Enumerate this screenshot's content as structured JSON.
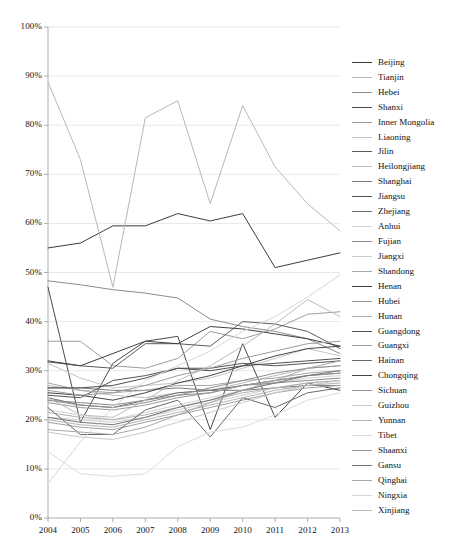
{
  "chart_data": {
    "type": "line",
    "title": "",
    "xlabel": "",
    "ylabel": "",
    "x": [
      2004,
      2005,
      2006,
      2007,
      2008,
      2009,
      2010,
      2011,
      2012,
      2013
    ],
    "xticklabels": [
      "2004",
      "2005",
      "2006",
      "2007",
      "2008",
      "2009",
      "2010",
      "2011",
      "2012",
      "2013"
    ],
    "yticklabels": [
      "0%",
      "10%",
      "20%",
      "30%",
      "40%",
      "50%",
      "60%",
      "70%",
      "80%",
      "90%",
      "100%"
    ],
    "yticks": [
      0,
      10,
      20,
      30,
      40,
      50,
      60,
      70,
      80,
      90,
      100
    ],
    "ylim": [
      0,
      100
    ],
    "grid": "horizontal",
    "legend_position": "right",
    "units": "percent",
    "series": [
      {
        "name": "Beijing",
        "color": "#3d3d3d",
        "values": [
          55.0,
          56.0,
          59.5,
          59.5,
          62.0,
          60.5,
          62.0,
          51.0,
          52.5,
          54.0
        ]
      },
      {
        "name": "Tianjin",
        "color": "#b8b8b8",
        "values": [
          88.8,
          73.0,
          47.0,
          81.5,
          85.0,
          64.0,
          84.0,
          71.5,
          64.0,
          58.5
        ]
      },
      {
        "name": "Hebei",
        "color": "#8c8c8c",
        "values": [
          48.3,
          47.5,
          46.5,
          45.8,
          44.8,
          40.5,
          39.0,
          38.0,
          36.5,
          33.5
        ]
      },
      {
        "name": "Shanxi",
        "color": "#4a4a4a",
        "values": [
          47.0,
          19.5,
          31.5,
          36.0,
          37.0,
          18.0,
          35.5,
          20.5,
          27.5,
          26.0
        ]
      },
      {
        "name": "Inner Mongolia",
        "color": "#9e9e9e",
        "values": [
          36.0,
          36.0,
          31.0,
          30.5,
          32.5,
          38.0,
          36.5,
          38.5,
          41.5,
          42.0
        ]
      },
      {
        "name": "Liaoning",
        "color": "#c4c4c4",
        "values": [
          31.5,
          28.5,
          26.5,
          27.0,
          27.5,
          28.5,
          30.5,
          32.5,
          34.5,
          33.0
        ]
      },
      {
        "name": "Jilin",
        "color": "#5c5c5c",
        "values": [
          31.8,
          31.0,
          30.5,
          35.5,
          35.5,
          35.0,
          40.0,
          39.5,
          38.0,
          34.5
        ]
      },
      {
        "name": "Heilongjiang",
        "color": "#bfbfbf",
        "values": [
          27.0,
          26.0,
          25.0,
          24.5,
          25.5,
          26.0,
          27.5,
          29.0,
          30.5,
          31.0
        ]
      },
      {
        "name": "Shanghai",
        "color": "#7a7a7a",
        "values": [
          26.5,
          26.5,
          26.0,
          26.0,
          26.5,
          26.0,
          26.0,
          26.5,
          27.0,
          27.0
        ]
      },
      {
        "name": "Jiangsu",
        "color": "#545454",
        "values": [
          25.0,
          24.5,
          28.0,
          29.0,
          30.5,
          30.5,
          31.5,
          31.0,
          31.5,
          32.0
        ]
      },
      {
        "name": "Zhejiang",
        "color": "#6e6e6e",
        "values": [
          24.5,
          23.0,
          22.5,
          24.0,
          25.5,
          26.0,
          27.0,
          28.0,
          29.0,
          29.5
        ]
      },
      {
        "name": "Anhui",
        "color": "#d2d2d2",
        "values": [
          22.0,
          21.0,
          20.0,
          21.5,
          23.0,
          24.5,
          26.0,
          27.5,
          28.5,
          29.0
        ]
      },
      {
        "name": "Fujian",
        "color": "#8a8a8a",
        "values": [
          24.0,
          23.5,
          23.0,
          24.0,
          25.0,
          25.5,
          27.0,
          27.5,
          28.0,
          28.5
        ]
      },
      {
        "name": "Jiangxi",
        "color": "#cccccc",
        "values": [
          20.5,
          20.0,
          19.5,
          20.5,
          22.0,
          23.5,
          25.0,
          26.5,
          27.5,
          28.0
        ]
      },
      {
        "name": "Shandong",
        "color": "#a6a6a6",
        "values": [
          27.5,
          26.0,
          25.5,
          26.0,
          27.0,
          27.0,
          28.0,
          28.5,
          29.5,
          30.0
        ]
      },
      {
        "name": "Henan",
        "color": "#3f3f3f",
        "values": [
          32.0,
          31.0,
          33.5,
          36.0,
          35.5,
          39.0,
          38.5,
          37.5,
          36.5,
          35.0
        ]
      },
      {
        "name": "Hubei",
        "color": "#9a9a9a",
        "values": [
          23.5,
          22.5,
          22.0,
          23.0,
          24.5,
          25.5,
          27.0,
          28.0,
          29.0,
          29.5
        ]
      },
      {
        "name": "Hunan",
        "color": "#b0b0b0",
        "values": [
          21.5,
          20.5,
          20.0,
          21.0,
          22.5,
          24.0,
          25.5,
          26.5,
          27.5,
          28.0
        ]
      },
      {
        "name": "Guangdong",
        "color": "#4f4f4f",
        "values": [
          26.5,
          26.5,
          27.0,
          28.5,
          30.5,
          30.0,
          31.0,
          31.5,
          32.0,
          32.5
        ]
      },
      {
        "name": "Guangxi",
        "color": "#a0a0a0",
        "values": [
          19.5,
          18.5,
          18.0,
          19.5,
          21.0,
          22.5,
          24.0,
          25.5,
          26.5,
          27.0
        ]
      },
      {
        "name": "Hainan",
        "color": "#6a6a6a",
        "values": [
          22.5,
          17.0,
          17.0,
          22.0,
          24.0,
          16.5,
          24.5,
          22.5,
          25.5,
          26.5
        ]
      },
      {
        "name": "Chongqing",
        "color": "#444444",
        "values": [
          25.5,
          25.0,
          24.0,
          25.5,
          27.5,
          29.0,
          31.0,
          33.0,
          34.5,
          35.0
        ]
      },
      {
        "name": "Sichuan",
        "color": "#8f8f8f",
        "values": [
          24.0,
          23.0,
          22.5,
          23.5,
          25.0,
          26.5,
          28.0,
          29.5,
          30.5,
          31.0
        ]
      },
      {
        "name": "Guizhou",
        "color": "#c8c8c8",
        "values": [
          17.5,
          16.5,
          16.0,
          17.5,
          19.5,
          21.5,
          23.5,
          25.5,
          27.0,
          28.0
        ]
      },
      {
        "name": "Yunnan",
        "color": "#b4b4b4",
        "values": [
          20.0,
          19.0,
          18.5,
          20.0,
          21.5,
          23.0,
          24.5,
          26.0,
          27.0,
          27.5
        ]
      },
      {
        "name": "Tibet",
        "color": "#dcdcdc",
        "values": [
          13.5,
          9.0,
          8.5,
          9.0,
          14.5,
          17.5,
          18.5,
          21.0,
          24.0,
          25.5
        ]
      },
      {
        "name": "Shaanxi",
        "color": "#9c9c9c",
        "values": [
          26.0,
          25.0,
          25.5,
          27.0,
          29.0,
          30.5,
          32.5,
          34.0,
          35.5,
          36.0
        ]
      },
      {
        "name": "Gansu",
        "color": "#757575",
        "values": [
          20.5,
          19.5,
          19.0,
          20.5,
          22.5,
          24.0,
          26.0,
          27.5,
          29.0,
          30.0
        ]
      },
      {
        "name": "Qinghai",
        "color": "#a8a8a8",
        "values": [
          18.0,
          17.5,
          17.0,
          18.5,
          21.0,
          23.5,
          26.0,
          28.0,
          30.5,
          32.0
        ]
      },
      {
        "name": "Ningxia",
        "color": "#d6d6d6",
        "values": [
          7.0,
          15.5,
          22.5,
          28.0,
          31.0,
          34.0,
          38.0,
          41.0,
          45.0,
          49.5
        ]
      },
      {
        "name": "Xinjiang",
        "color": "#bdbdbd",
        "values": [
          24.5,
          21.0,
          20.5,
          24.0,
          28.0,
          31.0,
          35.0,
          39.5,
          44.5,
          41.0
        ]
      }
    ]
  },
  "axes": {
    "plot_left": 48,
    "plot_right": 340,
    "plot_top": 27,
    "plot_bottom": 518
  }
}
